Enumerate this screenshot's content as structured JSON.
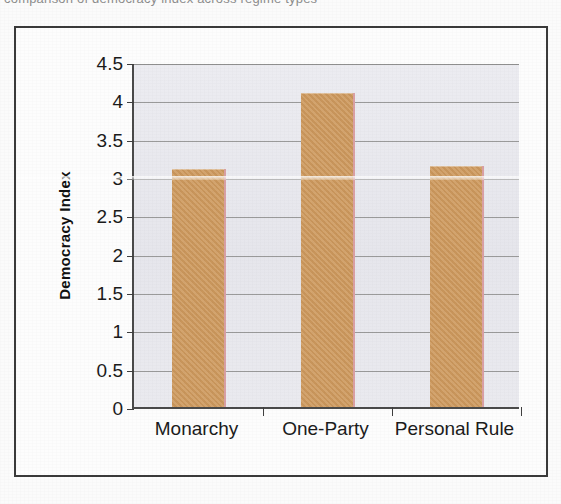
{
  "page": {
    "top_caption_clipped": "comparison of democracy index across regime types"
  },
  "chart_data": {
    "type": "bar",
    "title": "",
    "xlabel": "",
    "ylabel": "Democracy Index",
    "categories": [
      "Monarchy",
      "One-Party",
      "Personal Rule"
    ],
    "values": [
      3.1,
      4.1,
      3.15
    ],
    "ylim": [
      0,
      4.5
    ],
    "ytick_labels": [
      "0",
      "0.5",
      "1",
      "1.5",
      "2",
      "2.5",
      "3",
      "3.5",
      "4",
      "4.5"
    ],
    "ytick_values": [
      0,
      0.5,
      1,
      1.5,
      2,
      2.5,
      3,
      3.5,
      4,
      4.5
    ],
    "grid": true,
    "legend": "none",
    "bar_color": "#ce9a5e",
    "plot_background": "#e9e9ee",
    "axis_color": "#3f3f3f"
  }
}
